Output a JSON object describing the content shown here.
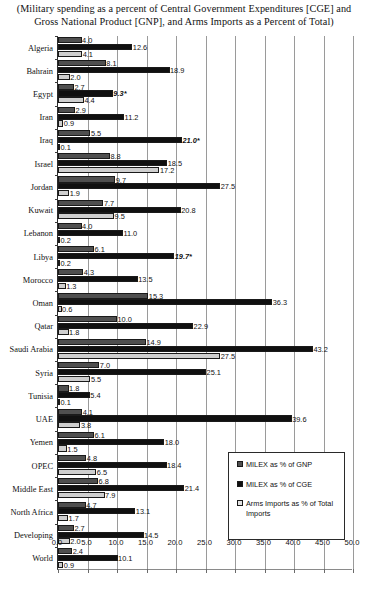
{
  "title": "(Military spending as a percent of Central Government Expenditures [CGE] and Gross National Product [GNP], and Arms Imports as a Percent of Total)",
  "legend": {
    "items": [
      {
        "key": "gnp",
        "label": "MILEX as % of GNP",
        "swatch_color": "#4f4f4f"
      },
      {
        "key": "cge",
        "label": "MILEX as % of CGE",
        "swatch_color": "#101010"
      },
      {
        "key": "arms",
        "label": "Arms Imports as % of Total Imports",
        "swatch_color": "#e2e2e2"
      }
    ]
  },
  "chart_data": {
    "type": "bar",
    "orientation": "horizontal",
    "title": "(Military spending as a percent of Central Government Expenditures [CGE] and Gross National Product [GNP], and Arms Imports as a Percent of Total)",
    "xlabel": "",
    "ylabel": "",
    "xlim": [
      0.0,
      50.0
    ],
    "xticks": [
      "0.0",
      "5.0",
      "10.0",
      "15.0",
      "20.0",
      "25.0",
      "30.0",
      "35.0",
      "40.0",
      "45.0",
      "50.0"
    ],
    "xtick_values": [
      0,
      5,
      10,
      15,
      20,
      25,
      30,
      35,
      40,
      45,
      50
    ],
    "grid": true,
    "legend_position": "inside-lower-right",
    "categories": [
      "Algeria",
      "Bahrain",
      "Egypt",
      "Iran",
      "Iraq",
      "Israel",
      "Jordan",
      "Kuwait",
      "Lebanon",
      "Libya",
      "Morocco",
      "Oman",
      "Qatar",
      "Saudi Arabia",
      "Syria",
      "Tunisia",
      "UAE",
      "Yemen",
      "OPEC",
      "Middle East",
      "North Africa",
      "Developing",
      "World"
    ],
    "series": [
      {
        "name": "MILEX as % of GNP",
        "key": "gnp",
        "color": "#4f4f4f",
        "values": [
          4.0,
          8.1,
          2.7,
          2.9,
          5.5,
          8.8,
          9.7,
          7.7,
          4.0,
          6.1,
          4.3,
          15.3,
          10.0,
          14.9,
          7.0,
          1.8,
          4.1,
          6.1,
          4.8,
          6.8,
          4.7,
          2.7,
          2.4
        ],
        "labels": [
          "4.0",
          "8.1",
          "2.7",
          "2.9",
          "5.5",
          "8.8",
          "9.7",
          "7.7",
          "4.0",
          "6.1",
          "4.3",
          "15.3",
          "10.0",
          "14.9",
          "7.0",
          "1.8",
          "4.1",
          "6.1",
          "4.8",
          "6.8",
          "4.7",
          "2.7",
          "2.4"
        ],
        "estimated": [
          false,
          false,
          false,
          false,
          false,
          false,
          false,
          false,
          false,
          false,
          false,
          false,
          false,
          false,
          false,
          false,
          false,
          false,
          false,
          false,
          false,
          false,
          false
        ]
      },
      {
        "name": "MILEX as % of CGE",
        "key": "cge",
        "color": "#101010",
        "values": [
          12.6,
          18.9,
          9.3,
          11.2,
          21.0,
          18.5,
          27.5,
          20.8,
          11.0,
          19.7,
          13.5,
          36.3,
          22.9,
          43.2,
          25.1,
          5.4,
          39.6,
          18.0,
          18.4,
          21.4,
          13.1,
          14.5,
          10.1
        ],
        "labels": [
          "12.6",
          "18.9",
          "9.3*",
          "11.2",
          "21.0*",
          "18.5",
          "27.5",
          "20.8",
          "11.0",
          "19.7*",
          "13.5",
          "36.3",
          "22.9",
          "43.2",
          "25.1",
          "5.4",
          "39.6",
          "18.0",
          "18.4",
          "21.4",
          "13.1",
          "14.5",
          "10.1"
        ],
        "estimated": [
          false,
          false,
          true,
          false,
          true,
          false,
          false,
          false,
          false,
          true,
          false,
          false,
          false,
          false,
          false,
          false,
          false,
          false,
          false,
          false,
          false,
          false,
          false
        ]
      },
      {
        "name": "Arms Imports as % of Total Imports",
        "key": "arms",
        "color": "#e2e2e2",
        "values": [
          4.1,
          2.0,
          4.4,
          0.9,
          0.1,
          17.2,
          1.9,
          9.5,
          0.2,
          0.2,
          1.3,
          0.6,
          1.8,
          27.5,
          5.5,
          0.1,
          3.8,
          1.5,
          6.5,
          7.9,
          1.7,
          2.0,
          0.9
        ],
        "labels": [
          "4.1",
          "2.0",
          "4.4",
          "0.9",
          "0.1",
          "17.2",
          "1.9",
          "9.5",
          "0.2",
          "0.2",
          "1.3",
          "0.6",
          "1.8",
          "27.5",
          "5.5",
          "0.1",
          "3.8",
          "1.5",
          "6.5",
          "7.9",
          "1.7",
          "2.0",
          "0.9"
        ],
        "estimated": [
          false,
          false,
          false,
          false,
          false,
          false,
          false,
          false,
          false,
          false,
          false,
          false,
          false,
          false,
          false,
          false,
          false,
          false,
          false,
          false,
          false,
          false,
          false
        ]
      }
    ]
  }
}
